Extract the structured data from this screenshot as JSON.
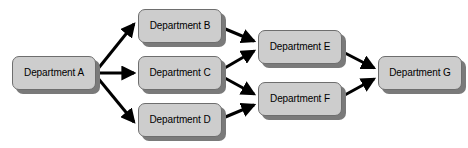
{
  "diagram": {
    "type": "directed-graph",
    "background_color": "#ffffff",
    "node_fill_color": "#cdcdcd",
    "node_border_color": "#6e6e6e",
    "node_shadow_color": "#7a7a7a",
    "edge_color": "#000000",
    "label_color": "#000000",
    "nodes": [
      {
        "id": "a",
        "label": "Department A",
        "x": 12,
        "y": 56,
        "w": 84,
        "h": 34
      },
      {
        "id": "b",
        "label": "Department B",
        "x": 138,
        "y": 9,
        "w": 84,
        "h": 34
      },
      {
        "id": "c",
        "label": "Department C",
        "x": 138,
        "y": 56,
        "w": 84,
        "h": 34
      },
      {
        "id": "d",
        "label": "Department D",
        "x": 138,
        "y": 103,
        "w": 84,
        "h": 34
      },
      {
        "id": "e",
        "label": "Department E",
        "x": 258,
        "y": 30,
        "w": 84,
        "h": 34
      },
      {
        "id": "f",
        "label": "Department F",
        "x": 258,
        "y": 82,
        "w": 84,
        "h": 34
      },
      {
        "id": "g",
        "label": "Department G",
        "x": 378,
        "y": 56,
        "w": 84,
        "h": 34
      }
    ],
    "edges": [
      {
        "id": "a-b",
        "from": "Department A",
        "to": "Department B",
        "x1": 97,
        "y1": 70,
        "x2": 134,
        "y2": 24
      },
      {
        "id": "a-c",
        "from": "Department A",
        "to": "Department C",
        "x1": 97,
        "y1": 73,
        "x2": 134,
        "y2": 73
      },
      {
        "id": "a-d",
        "from": "Department A",
        "to": "Department D",
        "x1": 97,
        "y1": 77,
        "x2": 134,
        "y2": 122
      },
      {
        "id": "b-e",
        "from": "Department B",
        "to": "Department E",
        "x1": 223,
        "y1": 28,
        "x2": 254,
        "y2": 41
      },
      {
        "id": "c-e",
        "from": "Department C",
        "to": "Department E",
        "x1": 223,
        "y1": 69,
        "x2": 254,
        "y2": 51
      },
      {
        "id": "c-f",
        "from": "Department C",
        "to": "Department F",
        "x1": 223,
        "y1": 77,
        "x2": 254,
        "y2": 94
      },
      {
        "id": "d-f",
        "from": "Department D",
        "to": "Department F",
        "x1": 223,
        "y1": 118,
        "x2": 254,
        "y2": 105
      },
      {
        "id": "e-g",
        "from": "Department E",
        "to": "Department G",
        "x1": 343,
        "y1": 52,
        "x2": 374,
        "y2": 68
      },
      {
        "id": "f-g",
        "from": "Department F",
        "to": "Department G",
        "x1": 343,
        "y1": 96,
        "x2": 374,
        "y2": 79
      }
    ]
  }
}
